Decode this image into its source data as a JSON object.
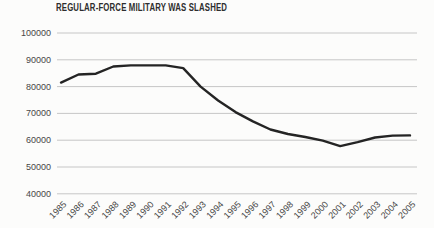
{
  "chart_data": {
    "type": "line",
    "title": "REGULAR-FORCE MILITARY WAS SLASHED",
    "categories": [
      "1985",
      "1986",
      "1987",
      "1988",
      "1989",
      "1990",
      "1991",
      "1992",
      "1993",
      "1994",
      "1995",
      "1996",
      "1997",
      "1998",
      "1999",
      "2000",
      "2001",
      "2002",
      "2003",
      "2004",
      "2005"
    ],
    "values": [
      81500,
      84500,
      84800,
      87500,
      87900,
      87900,
      87900,
      86900,
      80000,
      74800,
      70500,
      67000,
      64000,
      62300,
      61200,
      59800,
      57800,
      59300,
      61000,
      61700,
      61800
    ],
    "xlabel": "",
    "ylabel": "",
    "ylim": [
      40000,
      100000
    ],
    "yticks": [
      40000,
      50000,
      60000,
      70000,
      80000,
      90000,
      100000
    ],
    "ytick_labels": [
      "40000",
      "50000",
      "60000",
      "70000",
      "80000",
      "90000",
      "100000"
    ],
    "grid": "horizontal",
    "legend": false,
    "style": {
      "line_color": "#242424",
      "grid_color": "#c6c6c6",
      "text_color": "#474747",
      "title_color": "#2e2e2e",
      "background": "#fcfcfb"
    }
  }
}
